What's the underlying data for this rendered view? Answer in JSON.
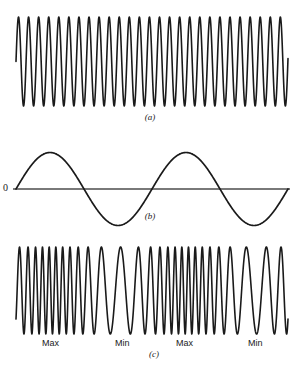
{
  "figure": {
    "background_color": "#ffffff",
    "stroke_color": "#1a1a1a",
    "axis_color": "#4d4d4d",
    "width": 303,
    "height": 369
  },
  "panels": [
    {
      "id": "a",
      "caption": "(a)",
      "description": "Unmodulated carrier wave, constant frequency",
      "role": "carrier"
    },
    {
      "id": "b",
      "caption": "(b)",
      "description": "Modulating signal, two-cycle sine wave about zero axis",
      "role": "modulating-signal",
      "zero_label": "0"
    },
    {
      "id": "c",
      "caption": "(c)",
      "description": "Frequency modulated carrier wave",
      "role": "fm-output",
      "fm_labels": [
        "Max",
        "Min",
        "Max",
        "Min"
      ]
    }
  ],
  "chart_data": [
    {
      "type": "line",
      "name": "carrier",
      "panel": "a",
      "title": "(a)",
      "xlabel": "",
      "ylabel": "",
      "grid": false,
      "legend": "none",
      "x_start_px": 16,
      "x_end_px": 288,
      "y_top_px": 17,
      "y_bottom_px": 106,
      "center_y_px": 61.5,
      "amplitude_px": 44.5,
      "cycles": 27,
      "period_px": 10.07,
      "phase_start": "mid-rising",
      "waveform": "sine",
      "frequency_constant": true
    },
    {
      "type": "line",
      "name": "modulating-signal",
      "panel": "b",
      "title": "(b)",
      "xlabel": "",
      "ylabel": "",
      "grid": false,
      "legend": "none",
      "x_start_px": 16,
      "x_end_px": 288,
      "zero_y_px": 189,
      "y_top_px": 153,
      "y_bottom_px": 226,
      "amplitude_px": 36.5,
      "cycles": 2,
      "period_px": 136,
      "phase_start": "zero-rising",
      "waveform": "sine",
      "axis_line": true,
      "zero_label": "0"
    },
    {
      "type": "line",
      "name": "fm-output",
      "panel": "c",
      "title": "(c)",
      "xlabel": "",
      "ylabel": "",
      "grid": false,
      "legend": "none",
      "x_start_px": 16,
      "x_end_px": 288,
      "y_top_px": 247,
      "y_bottom_px": 334,
      "center_y_px": 290.5,
      "amplitude_px": 43.5,
      "carrier_cycles": 27,
      "modulation_cycles": 2,
      "modulation_index": 7.0,
      "phase_start": "mid-rising",
      "waveform": "sine-fm",
      "frequency_constant": false,
      "annotations": [
        {
          "label": "Max",
          "x_px": 52,
          "y_px": 343,
          "meaning": "highest instantaneous frequency"
        },
        {
          "label": "Min",
          "x_px": 125,
          "y_px": 343,
          "meaning": "lowest instantaneous frequency"
        },
        {
          "label": "Max",
          "x_px": 186,
          "y_px": 343,
          "meaning": "highest instantaneous frequency"
        },
        {
          "label": "Min",
          "x_px": 258,
          "y_px": 343,
          "meaning": "lowest instantaneous frequency"
        }
      ]
    }
  ]
}
